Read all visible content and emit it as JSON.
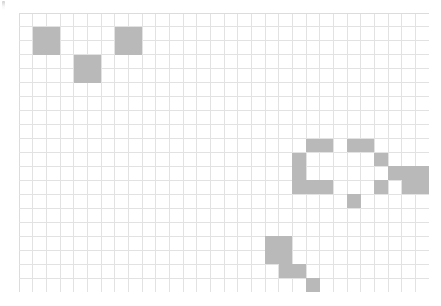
{
  "canvas": {
    "width": 441,
    "height": 306,
    "background_color": "#ffffff"
  },
  "artifact": {
    "name": "corner-mark",
    "description": "faint gray tick mark at top-left corner",
    "x": 2,
    "y": 1,
    "width": 3,
    "height": 9
  },
  "grid": {
    "origin_x": 19,
    "origin_y": 13,
    "cell_width": 13.65,
    "cell_height": 13.95,
    "columns": 30,
    "rows": 20,
    "line_color": "#e2e2e2",
    "border_color": "#dcdcdc",
    "fill_color": "#b9b9b9",
    "background_color": "#ffffff",
    "total_width": 410,
    "total_height": 279,
    "filled_count": 26
  },
  "chart_data": {
    "type": "heatmap",
    "title": "",
    "xlabel": "",
    "ylabel": "",
    "grid": true,
    "legend": "none",
    "columns": 30,
    "rows": 20,
    "value_on": 1,
    "value_off": 0,
    "filled_cells": [
      {
        "col": 1,
        "row": 1,
        "cluster": "top-left-block"
      },
      {
        "col": 2,
        "row": 1,
        "cluster": "top-left-block"
      },
      {
        "col": 1,
        "row": 2,
        "cluster": "top-left-block"
      },
      {
        "col": 2,
        "row": 2,
        "cluster": "top-left-block"
      },
      {
        "col": 7,
        "row": 1,
        "cluster": "top-mid-block"
      },
      {
        "col": 8,
        "row": 1,
        "cluster": "top-mid-block"
      },
      {
        "col": 7,
        "row": 2,
        "cluster": "top-mid-block"
      },
      {
        "col": 8,
        "row": 2,
        "cluster": "top-mid-block"
      },
      {
        "col": 4,
        "row": 3,
        "cluster": "upper-left-block"
      },
      {
        "col": 5,
        "row": 3,
        "cluster": "upper-left-block"
      },
      {
        "col": 4,
        "row": 4,
        "cluster": "upper-left-block"
      },
      {
        "col": 5,
        "row": 4,
        "cluster": "upper-left-block"
      },
      {
        "col": 21,
        "row": 9,
        "cluster": "c-shape"
      },
      {
        "col": 22,
        "row": 9,
        "cluster": "c-shape"
      },
      {
        "col": 24,
        "row": 9,
        "cluster": "c-shape"
      },
      {
        "col": 25,
        "row": 9,
        "cluster": "c-shape"
      },
      {
        "col": 20,
        "row": 10,
        "cluster": "c-shape"
      },
      {
        "col": 26,
        "row": 10,
        "cluster": "c-shape"
      },
      {
        "col": 20,
        "row": 11,
        "cluster": "c-shape"
      },
      {
        "col": 27,
        "row": 11,
        "cluster": "c-shape"
      },
      {
        "col": 20,
        "row": 12,
        "cluster": "c-shape"
      },
      {
        "col": 21,
        "row": 12,
        "cluster": "c-shape"
      },
      {
        "col": 22,
        "row": 12,
        "cluster": "c-shape"
      },
      {
        "col": 26,
        "row": 12,
        "cluster": "c-shape"
      },
      {
        "col": 24,
        "row": 13,
        "cluster": "c-shape"
      },
      {
        "col": 28,
        "row": 11,
        "cluster": "far-right-block"
      },
      {
        "col": 29,
        "row": 11,
        "cluster": "far-right-block"
      },
      {
        "col": 28,
        "row": 12,
        "cluster": "far-right-block"
      },
      {
        "col": 29,
        "row": 12,
        "cluster": "far-right-block"
      },
      {
        "col": 18,
        "row": 16,
        "cluster": "bottom-block"
      },
      {
        "col": 19,
        "row": 16,
        "cluster": "bottom-block"
      },
      {
        "col": 18,
        "row": 17,
        "cluster": "bottom-block"
      },
      {
        "col": 19,
        "row": 17,
        "cluster": "bottom-block"
      },
      {
        "col": 19,
        "row": 18,
        "cluster": "bottom-block"
      },
      {
        "col": 20,
        "row": 18,
        "cluster": "bottom-block"
      },
      {
        "col": 21,
        "row": 19,
        "cluster": "bottom-block"
      }
    ]
  }
}
